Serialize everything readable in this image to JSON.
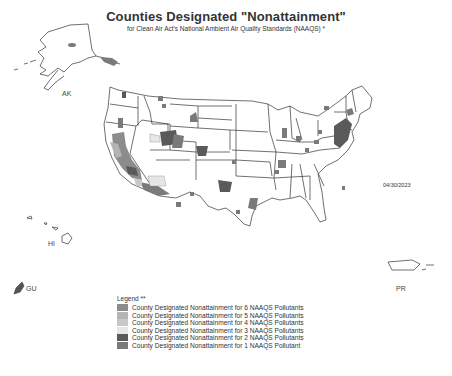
{
  "header": {
    "title": "Counties Designated \"Nonattainment\"",
    "subtitle": "for Clean Air Act's National Ambient Air Quality Standards (NAAQS) *"
  },
  "date": "04/30/2023",
  "labels": {
    "alaska": "AK",
    "hawaii": "HI",
    "guam": "GU",
    "puerto_rico": "PR"
  },
  "legend": {
    "title": "Legend **",
    "items": [
      {
        "label": "County Designated Nonattainment for 6 NAAQS Pollutants",
        "color": "#8c8c8c"
      },
      {
        "label": "County Designated Nonattainment for 5 NAAQS Pollutants",
        "color": "#b4b4b4"
      },
      {
        "label": "County Designated Nonattainment for 4 NAAQS Pollutants",
        "color": "#c8c8c8"
      },
      {
        "label": "County Designated Nonattainment for 3 NAAQS Pollutants",
        "color": "#e6e6e6"
      },
      {
        "label": "County Designated Nonattainment for 2 NAAQS Pollutants",
        "color": "#5a5a5a"
      },
      {
        "label": "County Designated Nonattainment for 1 NAAQS Pollutant",
        "color": "#7a7a7a"
      }
    ]
  },
  "colors": {
    "outline": "#333333",
    "background": "#ffffff"
  }
}
